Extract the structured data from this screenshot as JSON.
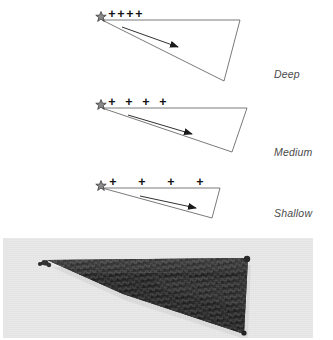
{
  "figure": {
    "panels": [
      {
        "id": "deep",
        "label": "Deep",
        "marker": "star-icon",
        "increase_symbols": [
          "+",
          "+",
          "+",
          "+"
        ],
        "symbol_count": 4,
        "arrow": "arrow-icon",
        "shape": "triangle",
        "apex": "top-left",
        "depth_description": "Deep"
      },
      {
        "id": "medium",
        "label": "Medium",
        "marker": "star-icon",
        "increase_symbols": [
          "+",
          "+",
          "+",
          "+"
        ],
        "symbol_count": 4,
        "arrow": "arrow-icon",
        "shape": "triangle",
        "apex": "top-left",
        "depth_description": "Medium"
      },
      {
        "id": "shallow",
        "label": "Shallow",
        "marker": "star-icon",
        "increase_symbols": [
          "+",
          "+",
          "+",
          "+"
        ],
        "symbol_count": 4,
        "arrow": "arrow-icon",
        "shape": "triangle",
        "apex": "top-left",
        "depth_description": "Shallow"
      }
    ],
    "photo": {
      "name": "knitted-triangular-shawl-photo",
      "subject": "dark knitted triangular shawl",
      "background_color": "#e8e8e8",
      "yarn_color": "#2e2e2e"
    },
    "colors": {
      "outline": "#6b6b6b",
      "symbol": "#1a1a1a",
      "label_text": "#4a4a4a",
      "photo_background": "#e8e8e8",
      "shawl": "#2e2e2e"
    }
  }
}
